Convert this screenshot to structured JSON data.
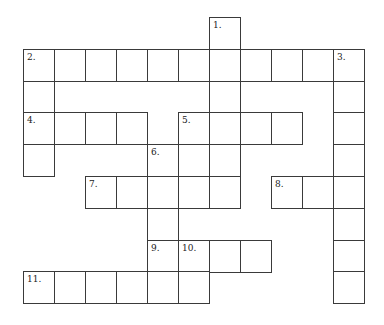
{
  "puzzle": {
    "type": "crossword",
    "grid": {
      "origin_x": 23,
      "origin_y": 17,
      "cell_w": 31,
      "cell_h": 31.8,
      "line_color": "#3a3a3a"
    },
    "cells": [
      {
        "r": 0,
        "c": 6,
        "num": "1."
      },
      {
        "r": 1,
        "c": 0,
        "num": "2."
      },
      {
        "r": 1,
        "c": 1
      },
      {
        "r": 1,
        "c": 2
      },
      {
        "r": 1,
        "c": 3
      },
      {
        "r": 1,
        "c": 4
      },
      {
        "r": 1,
        "c": 5
      },
      {
        "r": 1,
        "c": 6
      },
      {
        "r": 1,
        "c": 7
      },
      {
        "r": 1,
        "c": 8
      },
      {
        "r": 1,
        "c": 9
      },
      {
        "r": 1,
        "c": 10,
        "num": "3."
      },
      {
        "r": 2,
        "c": 0
      },
      {
        "r": 2,
        "c": 6
      },
      {
        "r": 2,
        "c": 10
      },
      {
        "r": 3,
        "c": 0,
        "num": "4."
      },
      {
        "r": 3,
        "c": 1
      },
      {
        "r": 3,
        "c": 2
      },
      {
        "r": 3,
        "c": 3
      },
      {
        "r": 3,
        "c": 5,
        "num": "5."
      },
      {
        "r": 3,
        "c": 6
      },
      {
        "r": 3,
        "c": 7
      },
      {
        "r": 3,
        "c": 8
      },
      {
        "r": 3,
        "c": 10
      },
      {
        "r": 4,
        "c": 0
      },
      {
        "r": 4,
        "c": 4,
        "num": "6."
      },
      {
        "r": 4,
        "c": 5
      },
      {
        "r": 4,
        "c": 6
      },
      {
        "r": 4,
        "c": 10
      },
      {
        "r": 5,
        "c": 2,
        "num": "7."
      },
      {
        "r": 5,
        "c": 3
      },
      {
        "r": 5,
        "c": 4
      },
      {
        "r": 5,
        "c": 5
      },
      {
        "r": 5,
        "c": 6
      },
      {
        "r": 5,
        "c": 8,
        "num": "8."
      },
      {
        "r": 5,
        "c": 9
      },
      {
        "r": 5,
        "c": 10
      },
      {
        "r": 6,
        "c": 4
      },
      {
        "r": 6,
        "c": 10
      },
      {
        "r": 7,
        "c": 4,
        "num": "9."
      },
      {
        "r": 7,
        "c": 5,
        "num": "10."
      },
      {
        "r": 7,
        "c": 6
      },
      {
        "r": 7,
        "c": 7
      },
      {
        "r": 7,
        "c": 10
      },
      {
        "r": 8,
        "c": 0,
        "num": "11."
      },
      {
        "r": 8,
        "c": 1
      },
      {
        "r": 8,
        "c": 2
      },
      {
        "r": 8,
        "c": 3
      },
      {
        "r": 8,
        "c": 4
      },
      {
        "r": 8,
        "c": 5
      },
      {
        "r": 8,
        "c": 10
      }
    ],
    "clue_numbers": [
      "1.",
      "2.",
      "3.",
      "4.",
      "5.",
      "6.",
      "7.",
      "8.",
      "9.",
      "10.",
      "11."
    ]
  }
}
